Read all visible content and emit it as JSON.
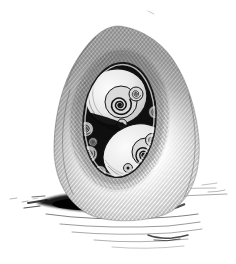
{
  "illustration": {
    "description": "Black-and-white pen-and-ink drawing of an upright egg with an oval opening cut into its shell, revealing nested coiled spiral snail-like forms inside; the egg casts a dark hatched shadow onto a ground suggested by sketchy horizontal strokes",
    "subject": "egg with spiral forms inside",
    "technique": "crosshatched ink sketch",
    "palette": {
      "background": "#ffffff",
      "ink": "#1a1a1a",
      "shell_shading": "#c4c4c4",
      "cavity_interior": "#0f0f0f",
      "form_highlight": "#ececec"
    },
    "elements": [
      "egg-shell",
      "oval-opening",
      "spiral-forms",
      "cast-shadow",
      "ground-hatching"
    ]
  }
}
